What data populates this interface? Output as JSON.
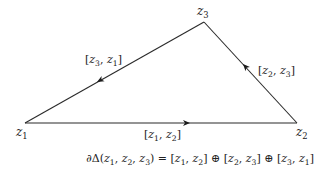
{
  "diagram": {
    "type": "oriented-triangle",
    "vertices": [
      {
        "id": "z1",
        "name": "z",
        "sub": "1",
        "x": 25,
        "y": 123
      },
      {
        "id": "z2",
        "name": "z",
        "sub": "2",
        "x": 297,
        "y": 123
      },
      {
        "id": "z3",
        "name": "z",
        "sub": "3",
        "x": 204,
        "y": 22
      }
    ],
    "edges": [
      {
        "from": "z1",
        "to": "z2",
        "label": "[z1, z2]",
        "direction": "right"
      },
      {
        "from": "z2",
        "to": "z3",
        "label": "[z2, z3]",
        "direction": "up-left"
      },
      {
        "from": "z3",
        "to": "z1",
        "label": "[z3, z1]",
        "direction": "down-left"
      }
    ],
    "labels": {
      "z1": {
        "name": "z",
        "sub": "1"
      },
      "z2": {
        "name": "z",
        "sub": "2"
      },
      "z3": {
        "name": "z",
        "sub": "3"
      },
      "edge_z1_z2": {
        "a": "z",
        "a_sub": "1",
        "b": "z",
        "b_sub": "2"
      },
      "edge_z2_z3": {
        "a": "z",
        "a_sub": "2",
        "b": "z",
        "b_sub": "3"
      },
      "edge_z3_z1": {
        "a": "z",
        "a_sub": "3",
        "b": "z",
        "b_sub": "1"
      }
    },
    "formula": {
      "text": "∂Δ(z1, z2, z3) = [z1, z2] ⊕ [z2, z3] ⊕ [z3, z1]",
      "boundary_symbol": "∂Δ",
      "equals": "=",
      "direct_sum": "⊕"
    },
    "colors": {
      "stroke": "#2a2a2a",
      "text": "#222222",
      "background": "#ffffff"
    }
  }
}
